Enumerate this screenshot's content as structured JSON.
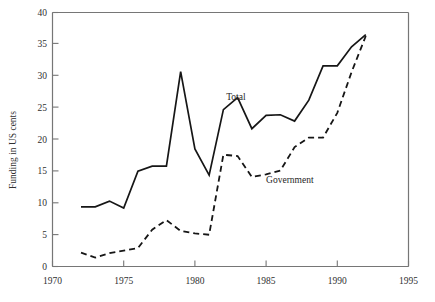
{
  "chart_data": {
    "type": "line",
    "title": "",
    "subtitle": "",
    "xlabel": "",
    "ylabel": "Funding in US cents",
    "xlim": [
      1970,
      1995
    ],
    "ylim": [
      0,
      40
    ],
    "xticks": [
      1970,
      1975,
      1980,
      1985,
      1990,
      1995
    ],
    "yticks": [
      0,
      5,
      10,
      15,
      20,
      25,
      30,
      35,
      40
    ],
    "grid": false,
    "legend_position": "inline-annotations",
    "annotations": [
      {
        "text": "Total",
        "x": 1982.2,
        "y": 26.2
      },
      {
        "text": "Government",
        "x": 1985.0,
        "y": 13.2
      }
    ],
    "x": [
      1972,
      1973,
      1974,
      1975,
      1976,
      1977,
      1978,
      1979,
      1980,
      1981,
      1982,
      1983,
      1984,
      1985,
      1986,
      1987,
      1988,
      1989,
      1990,
      1991,
      1992
    ],
    "series": [
      {
        "name": "Total",
        "style": "solid",
        "color": "#161616",
        "values": [
          9.4,
          9.4,
          10.3,
          9.2,
          15.0,
          15.8,
          15.8,
          30.7,
          18.5,
          14.4,
          24.7,
          26.6,
          21.7,
          23.8,
          23.9,
          22.9,
          26.2,
          31.6,
          31.6,
          34.6,
          36.5
        ]
      },
      {
        "name": "Government",
        "style": "dashed",
        "color": "#161616",
        "values": [
          2.2,
          1.4,
          2.1,
          2.5,
          2.9,
          5.8,
          7.3,
          5.6,
          5.2,
          5.0,
          17.6,
          17.4,
          14.1,
          14.5,
          15.1,
          18.8,
          20.3,
          20.3,
          24.2,
          30.6,
          36.3
        ]
      }
    ]
  },
  "axis": {
    "y_title": "Funding in US cents",
    "y_tick_labels": [
      "0",
      "5",
      "10",
      "15",
      "20",
      "25",
      "30",
      "35",
      "40"
    ],
    "x_tick_labels": [
      "1970",
      "1975",
      "1980",
      "1985",
      "1990",
      "1995"
    ]
  },
  "labels": {
    "total": "Total",
    "government": "Government"
  }
}
